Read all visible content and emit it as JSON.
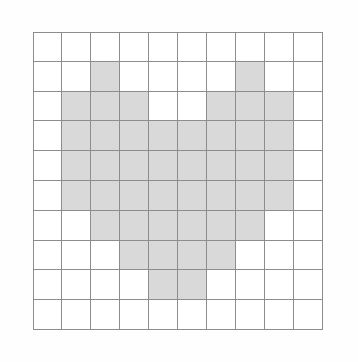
{
  "figure": {
    "title": "",
    "background_color": "#fefefe"
  },
  "chart_data": {
    "type": "heatmap",
    "title": "",
    "subtitle": "",
    "xlabel": "",
    "ylabel": "",
    "rows": 10,
    "columns": 10,
    "grid": true,
    "legend": "none",
    "shape_name": "heart",
    "filled_color": "#d9d9d9",
    "empty_color": "#ffffff",
    "grid_line_color": "#8d8d8d",
    "x": [
      0,
      1,
      2,
      3,
      4,
      5,
      6,
      7,
      8,
      9
    ],
    "y": [
      0,
      1,
      2,
      3,
      4,
      5,
      6,
      7,
      8,
      9
    ],
    "xtick_labels": [],
    "ytick_labels": [],
    "values": [
      [
        0,
        0,
        0,
        0,
        0,
        0,
        0,
        0,
        0,
        0
      ],
      [
        0,
        0,
        1,
        0,
        0,
        0,
        0,
        1,
        0,
        0
      ],
      [
        0,
        1,
        1,
        1,
        0,
        0,
        1,
        1,
        1,
        0
      ],
      [
        0,
        1,
        1,
        1,
        1,
        1,
        1,
        1,
        1,
        0
      ],
      [
        0,
        1,
        1,
        1,
        1,
        1,
        1,
        1,
        1,
        0
      ],
      [
        0,
        1,
        1,
        1,
        1,
        1,
        1,
        1,
        1,
        0
      ],
      [
        0,
        0,
        1,
        1,
        1,
        1,
        1,
        1,
        0,
        0
      ],
      [
        0,
        0,
        0,
        1,
        1,
        1,
        1,
        0,
        0,
        0
      ],
      [
        0,
        0,
        0,
        0,
        1,
        1,
        0,
        0,
        0,
        0
      ],
      [
        0,
        0,
        0,
        0,
        0,
        0,
        0,
        0,
        0,
        0
      ]
    ],
    "filled_cell_count": 52,
    "total_cell_count": 100,
    "row_filled_counts": [
      0,
      2,
      6,
      8,
      8,
      8,
      6,
      4,
      2,
      0
    ]
  }
}
